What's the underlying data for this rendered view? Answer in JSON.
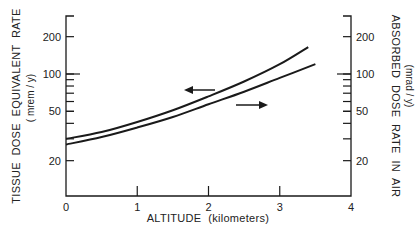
{
  "chart_data": {
    "type": "line",
    "title": "",
    "xlabel": "ALTITUDE  (kilometers)",
    "ylabel_left": "TISSUE  DOSE  EQUIVALENT  RATE",
    "ylabel_left_unit": "( mrem / y)",
    "ylabel_right": "ABSORBED  DOSE  RATE  IN  AIR",
    "ylabel_right_unit": "(mrad / y)",
    "xlim": [
      0,
      4
    ],
    "ylim": [
      10,
      300
    ],
    "yscale": "log",
    "grid": false,
    "x_ticks": [
      "0",
      "1",
      "2",
      "3",
      "4"
    ],
    "y_ticks_left": [
      "20",
      "50",
      "100",
      "200"
    ],
    "y_ticks_right": [
      "20",
      "50",
      "100",
      "200"
    ],
    "series": [
      {
        "name": "Tissue dose equivalent rate (left axis)",
        "axis": "left",
        "x": [
          0,
          0.5,
          1.0,
          1.5,
          2.0,
          2.5,
          3.0,
          3.4
        ],
        "values": [
          30,
          34,
          41,
          51,
          66,
          87,
          120,
          165
        ]
      },
      {
        "name": "Absorbed dose rate in air (right axis)",
        "axis": "right",
        "x": [
          0,
          0.5,
          1.0,
          1.5,
          2.0,
          2.5,
          3.0,
          3.5
        ],
        "values": [
          27,
          31,
          37,
          45,
          57,
          72,
          93,
          120
        ]
      }
    ],
    "annotations": [
      {
        "type": "arrow",
        "direction": "left",
        "label": "upper curve refers to left axis"
      },
      {
        "type": "arrow",
        "direction": "right",
        "label": "lower curve refers to right axis"
      }
    ]
  }
}
